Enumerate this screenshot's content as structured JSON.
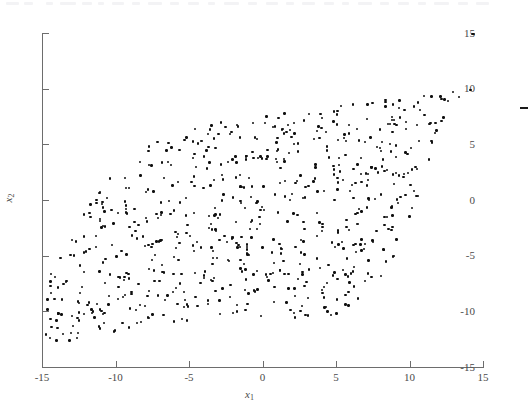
{
  "figure": {
    "kind": "scatter-plot",
    "background_color": "#ffffff",
    "point_color": "#101010",
    "axis_color": "#6d6d6d",
    "has_top_spine": false,
    "has_right_spine": false,
    "has_grid": false,
    "scan_artifact_top": true,
    "stray_mark": {
      "name": "stray-dash-mark",
      "x_data": 14.7,
      "y_data": 9.2
    }
  },
  "axes": {
    "x": {
      "label_main": "x",
      "label_sub": "1",
      "min": -15,
      "max": 15,
      "ticks": [
        -15,
        -10,
        -5,
        0,
        5,
        10,
        15
      ],
      "tick_labels": [
        "-15",
        "-10",
        "-5",
        "0",
        "5",
        "10",
        "15"
      ],
      "tick_direction": "in"
    },
    "y": {
      "label_main": "x",
      "label_sub": "2",
      "min": -15,
      "max": 15,
      "ticks": [
        -15,
        -10,
        -5,
        0,
        5,
        10,
        15
      ],
      "tick_labels": [
        "-15",
        "-10",
        "-5",
        "0",
        "5",
        "10",
        "15"
      ],
      "tick_direction": "in"
    }
  },
  "chart_data": {
    "type": "scatter",
    "title": "",
    "xlabel": "x1",
    "ylabel": "x2",
    "xlim": [
      -15,
      15
    ],
    "ylim": [
      -15,
      15
    ],
    "grid": false,
    "legend": null,
    "series": [
      {
        "name": "samples",
        "marker": "dot",
        "color": "#101010",
        "n_points": 712,
        "description": "Uniformly filled, strongly positively correlated tilted parallelogram cloud spanning roughly x in [-15, 14.5] and y in [-13, 10.5]; boundaries are two near-parallel lines of slope about 0.78 offset vertically, clipped by the axis extents.",
        "support_polygon": [
          [
            -15.0,
            -12.9
          ],
          [
            -10.4,
            -12.6
          ],
          [
            2.2,
            -10.6
          ],
          [
            9.6,
            -7.8
          ],
          [
            14.4,
            9.6
          ],
          [
            10.0,
            10.1
          ],
          [
            -1.4,
            7.3
          ],
          [
            -9.9,
            3.0
          ],
          [
            -14.6,
            -6.8
          ]
        ],
        "x": [
          -14.86,
          -14.62,
          -14.21,
          -13.88,
          -13.62,
          -13.41,
          -13.18,
          -12.94,
          -12.71,
          -12.48,
          -12.29,
          -12.05,
          -11.83,
          -11.62,
          -11.39,
          -11.18,
          -10.96,
          -10.74,
          -10.52,
          -10.31,
          -10.08,
          -9.86,
          -9.64,
          -9.43,
          -9.21,
          -8.99,
          -8.77,
          -8.56,
          -8.34,
          -8.12,
          -7.91,
          -7.69,
          -7.47,
          -7.26,
          -7.04,
          -6.82,
          -6.61,
          -6.39,
          -6.17,
          -5.96,
          -5.74,
          -5.52,
          -5.31,
          -5.09,
          -4.87,
          -4.66,
          -4.44,
          -4.22,
          -4.01,
          -3.79,
          -3.57,
          -3.36,
          -3.14,
          -2.92,
          -2.71,
          -2.49,
          -2.27,
          -2.06,
          -1.84,
          -1.62,
          -1.41,
          -1.19,
          -0.97,
          -0.76,
          -0.54,
          -0.32,
          -0.11,
          0.11,
          0.32,
          0.54,
          0.76,
          0.97,
          1.19,
          1.41,
          1.62,
          1.84,
          2.06,
          2.27,
          2.49,
          2.71,
          2.92,
          3.14,
          3.36,
          3.57,
          3.79,
          4.01,
          4.22,
          4.44,
          4.66,
          4.87,
          5.09,
          5.31,
          5.52,
          5.74,
          5.96,
          6.17,
          6.39,
          6.61,
          6.82,
          7.04,
          7.26,
          7.47,
          7.69,
          7.91,
          8.12,
          8.34,
          8.56,
          8.77,
          8.99,
          9.21,
          9.43,
          9.64,
          9.86,
          10.08,
          10.31,
          10.52,
          10.74,
          10.96,
          11.18,
          11.39,
          11.62,
          11.83,
          12.05,
          12.29,
          12.48,
          12.71,
          12.94,
          13.18,
          13.41,
          13.62,
          13.88,
          14.21,
          14.44
        ],
        "y_lower_boundary": [
          -12.9,
          -12.9,
          -12.85,
          -12.8,
          -12.78,
          -12.72,
          -12.68,
          -12.62,
          -12.58,
          -12.55,
          -12.5,
          -12.44,
          -12.4,
          -12.34,
          -12.28,
          -12.22,
          -12.18,
          -12.12,
          -12.06,
          -12.0,
          -11.94,
          -11.88,
          -11.82,
          -11.76,
          -11.7,
          -11.64,
          -11.6,
          -11.54,
          -11.5,
          -11.44,
          -11.4,
          -11.34,
          -11.3,
          -11.24,
          -11.2,
          -11.15,
          -11.12,
          -11.07,
          -11.04,
          -11.0,
          -10.96,
          -10.92,
          -10.9,
          -10.86,
          -10.82,
          -10.8,
          -10.76,
          -10.74,
          -10.7,
          -10.68,
          -10.65,
          -10.62,
          -10.6,
          -10.58,
          -10.56,
          -10.54,
          -10.52,
          -10.5,
          -10.48,
          -10.47,
          -10.46,
          -10.45,
          -10.44,
          -10.43,
          -10.43,
          -10.42,
          -10.42,
          -10.42,
          -10.42,
          -10.43,
          -10.44,
          -10.45,
          -10.46,
          -10.48,
          -10.5,
          -10.52,
          -10.54,
          -10.56,
          -10.58,
          -10.6,
          -10.62,
          -10.63,
          -10.64,
          -10.64,
          -10.63,
          -10.62,
          -10.6,
          -10.55,
          -10.5,
          -10.42,
          -10.32,
          -10.2,
          -10.05,
          -9.88,
          -9.68,
          -9.45,
          -9.2,
          -8.95,
          -8.7,
          -8.45,
          -8.2,
          -7.95,
          -7.7,
          -7.4,
          -7.05,
          -6.65,
          -6.2,
          -5.7,
          -5.15,
          -4.55,
          -3.9,
          -3.2,
          -2.45,
          -1.65,
          -0.8,
          0.1,
          1.05,
          2.0,
          2.95,
          3.9,
          4.8,
          5.6,
          6.3,
          6.9,
          7.4,
          7.85,
          8.25,
          8.6,
          8.9,
          9.2,
          9.5,
          9.6
        ],
        "y_upper_boundary": [
          -6.9,
          -6.3,
          -5.6,
          -4.95,
          -4.35,
          -3.8,
          -3.3,
          -2.8,
          -2.3,
          -1.85,
          -1.4,
          -0.95,
          -0.5,
          -0.05,
          0.35,
          0.75,
          1.15,
          1.5,
          1.85,
          2.2,
          2.5,
          2.8,
          3.05,
          3.3,
          3.55,
          3.78,
          4.0,
          4.2,
          4.4,
          4.58,
          4.76,
          4.92,
          5.08,
          5.22,
          5.36,
          5.5,
          5.62,
          5.74,
          5.86,
          5.96,
          6.06,
          6.16,
          6.24,
          6.32,
          6.4,
          6.48,
          6.55,
          6.62,
          6.68,
          6.74,
          6.8,
          6.86,
          6.92,
          6.97,
          7.02,
          7.07,
          7.12,
          7.17,
          7.22,
          7.27,
          7.32,
          7.37,
          7.42,
          7.47,
          7.52,
          7.57,
          7.62,
          7.67,
          7.72,
          7.77,
          7.82,
          7.86,
          7.9,
          7.95,
          8.0,
          8.04,
          8.08,
          8.12,
          8.16,
          8.2,
          8.24,
          8.28,
          8.32,
          8.35,
          8.38,
          8.42,
          8.45,
          8.48,
          8.51,
          8.54,
          8.57,
          8.6,
          8.63,
          8.66,
          8.69,
          8.72,
          8.75,
          8.78,
          8.81,
          8.84,
          8.87,
          8.9,
          8.92,
          8.95,
          8.98,
          9.0,
          9.03,
          9.06,
          9.09,
          9.12,
          9.15,
          9.18,
          9.21,
          9.24,
          9.27,
          9.3,
          9.33,
          9.36,
          9.39,
          9.42,
          9.45,
          9.48,
          9.52,
          9.56,
          9.6,
          9.65,
          9.7,
          9.76,
          9.82,
          9.9,
          10.0,
          10.1
        ]
      }
    ]
  }
}
